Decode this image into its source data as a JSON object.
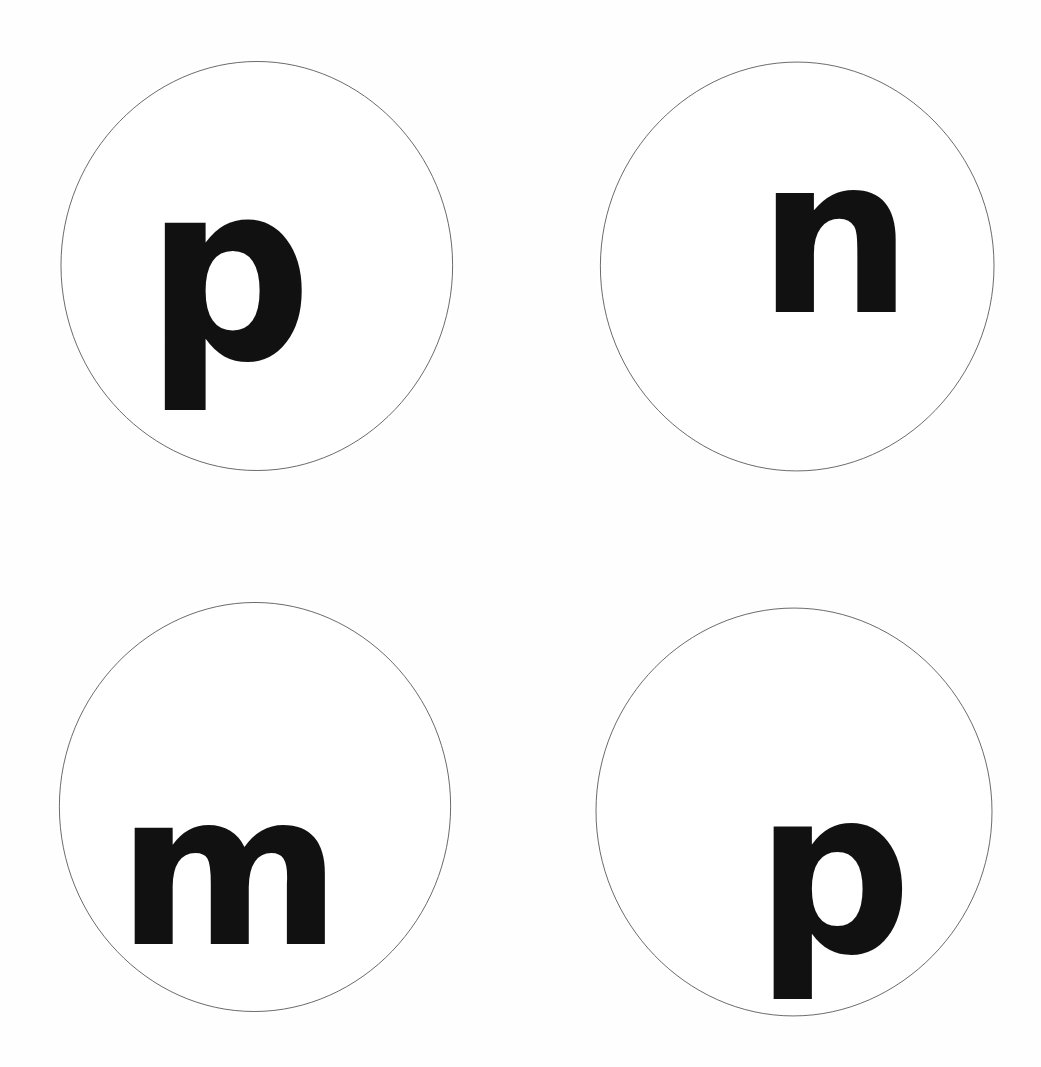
{
  "page": {
    "background_color": "#ffffff",
    "width": 1041,
    "height": 1067
  },
  "style": {
    "circle_outline_color": "#3a3a3a",
    "circle_outline_width": 1.6,
    "circle_fill_color": "#ffffff",
    "letter_color": "#111111"
  },
  "circles": [
    {
      "id": "circle-1",
      "position": "top-left",
      "letter": "p",
      "letter_case": "lowercase",
      "center_x": 257,
      "center_y": 266,
      "radius_x": 198,
      "radius_y": 207
    },
    {
      "id": "circle-2",
      "position": "top-right",
      "letter": "n",
      "letter_case": "lowercase",
      "center_x": 797,
      "center_y": 266,
      "radius_x": 199,
      "radius_y": 206
    },
    {
      "id": "circle-3",
      "position": "bottom-left",
      "letter": "m",
      "letter_case": "lowercase",
      "center_x": 255,
      "center_y": 807,
      "radius_x": 198,
      "radius_y": 207
    },
    {
      "id": "circle-4",
      "position": "bottom-right",
      "letter": "p",
      "letter_case": "lowercase",
      "center_x": 794,
      "center_y": 812,
      "radius_x": 200,
      "radius_y": 206
    }
  ]
}
